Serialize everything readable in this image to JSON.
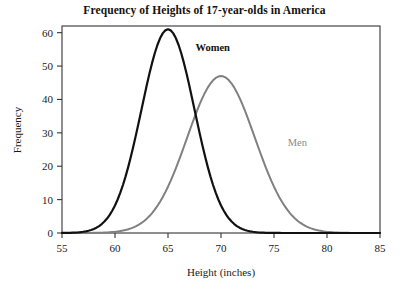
{
  "chart_data": {
    "type": "line",
    "title": "Frequency of Heights of 17-year-olds in America",
    "xlabel": "Height (inches)",
    "ylabel": "Frequency",
    "xlim": [
      55,
      85
    ],
    "ylim": [
      0,
      62
    ],
    "xticks": [
      55,
      60,
      65,
      70,
      75,
      80,
      85
    ],
    "yticks": [
      0,
      10,
      20,
      30,
      40,
      50,
      60
    ],
    "grid": false,
    "legend": "inline-annotations",
    "frame": "full-box",
    "series": [
      {
        "name": "Women",
        "color": "#111111",
        "linewidth": 2.2,
        "mean": 65,
        "sigma": 2.5,
        "peak": 61,
        "x": [
          55,
          56,
          57,
          58,
          59,
          60,
          61,
          62,
          63,
          64,
          65,
          66,
          67,
          68,
          69,
          70,
          71,
          72,
          73,
          74,
          75
        ],
        "values": [
          0.0,
          0.2,
          0.6,
          1.7,
          4.2,
          8.9,
          16.5,
          26.8,
          39.1,
          51.0,
          61.0,
          57.4,
          47.8,
          35.4,
          23.2,
          13.5,
          7.0,
          3.2,
          1.3,
          0.5,
          0.1
        ]
      },
      {
        "name": "Men",
        "color": "#808080",
        "linewidth": 2.0,
        "mean": 70,
        "sigma": 3.2,
        "peak": 47,
        "x": [
          55,
          56,
          57,
          58,
          59,
          60,
          61,
          62,
          63,
          64,
          65,
          66,
          67,
          68,
          69,
          70,
          71,
          72,
          73,
          74,
          75,
          76,
          77,
          78,
          79,
          80,
          81,
          82,
          83,
          84,
          85
        ],
        "values": [
          0.0,
          0.1,
          0.2,
          0.4,
          0.8,
          1.6,
          3.0,
          5.3,
          8.7,
          13.5,
          19.6,
          26.7,
          34.2,
          41.0,
          45.6,
          47.0,
          45.6,
          41.0,
          34.2,
          26.7,
          19.6,
          13.5,
          8.7,
          5.3,
          3.0,
          1.6,
          0.8,
          0.4,
          0.2,
          0.1,
          0.0
        ]
      }
    ],
    "annotations": [
      {
        "text": "Women",
        "x": 67.6,
        "y": 54.5,
        "color": "#111111",
        "bold": true
      },
      {
        "text": "Men",
        "x": 76.3,
        "y": 26.0,
        "color": "#8a8a8a",
        "bold": false
      }
    ]
  }
}
